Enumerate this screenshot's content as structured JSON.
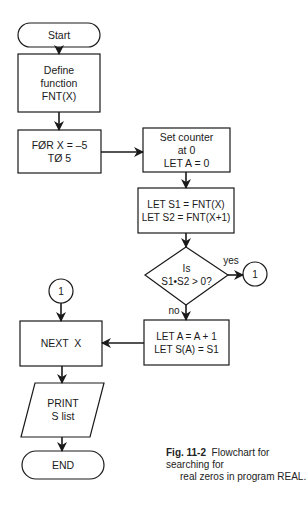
{
  "diagram": {
    "type": "flowchart",
    "nodes": [
      {
        "id": "start",
        "shape": "terminal",
        "lines": [
          "Start"
        ]
      },
      {
        "id": "define",
        "shape": "process",
        "lines": [
          "Define",
          "function",
          "FNT(X)"
        ]
      },
      {
        "id": "for",
        "shape": "process",
        "lines": [
          "FØR X = –5",
          "TØ 5"
        ]
      },
      {
        "id": "counter",
        "shape": "process",
        "lines": [
          "Set counter",
          "at 0",
          "LET A = 0"
        ]
      },
      {
        "id": "lets",
        "shape": "process",
        "lines": [
          "LET S1 = FNT(X)",
          "LET S2 = FNT(X+1)"
        ]
      },
      {
        "id": "decision",
        "shape": "decision",
        "lines": [
          "Is",
          "S1•S2 > 0?"
        ]
      },
      {
        "id": "conn_right",
        "shape": "connector",
        "lines": [
          "1"
        ]
      },
      {
        "id": "inc",
        "shape": "process",
        "lines": [
          "LET A = A + 1",
          "LET S(A) = S1"
        ]
      },
      {
        "id": "conn_left",
        "shape": "connector",
        "lines": [
          "1"
        ]
      },
      {
        "id": "next",
        "shape": "process",
        "lines": [
          "NEXT  X"
        ]
      },
      {
        "id": "print",
        "shape": "io",
        "lines": [
          "PRINT",
          "S list"
        ]
      },
      {
        "id": "end",
        "shape": "terminal",
        "lines": [
          "END"
        ]
      }
    ],
    "edges": [
      {
        "from": "start",
        "to": "define"
      },
      {
        "from": "define",
        "to": "for"
      },
      {
        "from": "for",
        "to": "counter"
      },
      {
        "from": "counter",
        "to": "lets"
      },
      {
        "from": "lets",
        "to": "decision"
      },
      {
        "from": "decision",
        "to": "conn_right",
        "label": "yes"
      },
      {
        "from": "decision",
        "to": "inc",
        "label": "no"
      },
      {
        "from": "inc",
        "to": "next"
      },
      {
        "from": "conn_left",
        "to": "next"
      },
      {
        "from": "next",
        "to": "print"
      },
      {
        "from": "print",
        "to": "end"
      }
    ],
    "edge_labels": {
      "yes": "yes",
      "no": "no"
    }
  },
  "caption": {
    "figure": "Fig. 11-2",
    "line1": "Flowchart for searching for",
    "line2": "real zeros in program REAL."
  }
}
